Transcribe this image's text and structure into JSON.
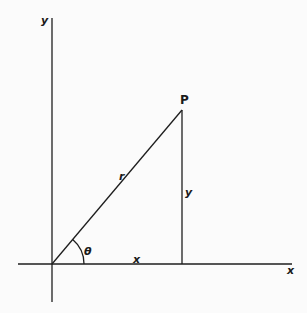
{
  "diagram": {
    "title": "",
    "type": "polar-coordinates",
    "labels": {
      "y_axis": "y",
      "x_axis": "x",
      "point": "P",
      "radius": "r",
      "vertical_side": "y",
      "horizontal_side": "x",
      "angle": "θ"
    },
    "geometry": {
      "origin": [
        52,
        264
      ],
      "point_P": [
        182,
        110
      ],
      "y_axis_range": [
        18,
        302
      ],
      "x_axis_range": [
        18,
        292
      ]
    },
    "colors": {
      "background": "#fbfbfb",
      "ink": "#1e1e1e"
    }
  }
}
